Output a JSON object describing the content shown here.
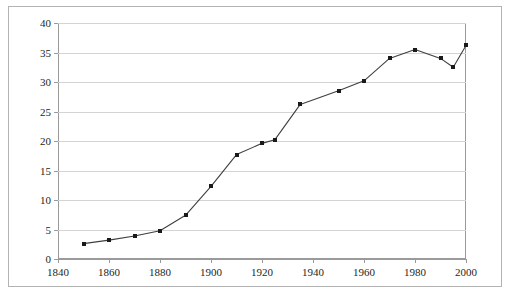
{
  "figure": {
    "background_color": "#ffffff",
    "frame_color": "#b3b3b3",
    "grid_color": "#d4d4d4",
    "axis_color": "#9a9a9a",
    "series_color": "#3f3f3f",
    "marker_color": "#1a1a1a",
    "caption_fragment": ""
  },
  "chart_data": {
    "type": "line",
    "title": "",
    "subtitle": "",
    "xlabel": "",
    "ylabel": "",
    "xlim": [
      1840,
      2000
    ],
    "ylim": [
      0,
      40
    ],
    "grid": true,
    "legend": false,
    "legend_position": "none",
    "markers": true,
    "xtick_labels": [
      "1840",
      "1860",
      "1880",
      "1900",
      "1920",
      "1940",
      "1960",
      "1980",
      "2000"
    ],
    "xticks": [
      1840,
      1860,
      1880,
      1900,
      1920,
      1940,
      1960,
      1980,
      2000
    ],
    "ytick_labels": [
      "0",
      "5",
      "10",
      "15",
      "20",
      "25",
      "30",
      "35",
      "40"
    ],
    "yticks": [
      0,
      5,
      10,
      15,
      20,
      25,
      30,
      35,
      40
    ],
    "x": [
      1850,
      1860,
      1870,
      1880,
      1890,
      1900,
      1910,
      1920,
      1925,
      1935,
      1950,
      1960,
      1970,
      1980,
      1990,
      1995,
      2000
    ],
    "values": [
      2.6,
      3.2,
      3.9,
      4.8,
      7.4,
      12.3,
      17.7,
      19.6,
      20.2,
      26.2,
      28.5,
      30.2,
      34.0,
      35.5,
      34.0,
      32.5,
      36.2
    ],
    "series": [
      {
        "name": "series-1",
        "x": [
          1850,
          1860,
          1870,
          1880,
          1890,
          1900,
          1910,
          1920,
          1925,
          1935,
          1950,
          1960,
          1970,
          1980,
          1990,
          1995,
          2000
        ],
        "values": [
          2.6,
          3.2,
          3.9,
          4.8,
          7.4,
          12.3,
          17.7,
          19.6,
          20.2,
          26.2,
          28.5,
          30.2,
          34.0,
          35.5,
          34.0,
          32.5,
          36.2
        ]
      }
    ],
    "annotations": []
  }
}
